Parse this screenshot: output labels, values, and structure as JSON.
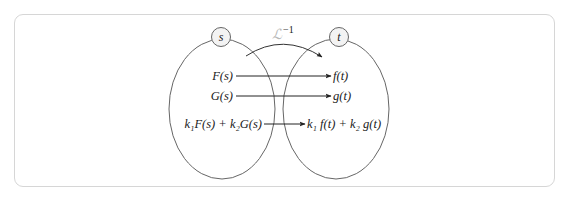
{
  "diagram": {
    "title_operator": {
      "symbol": "ℒ",
      "superscript": "−1"
    },
    "domains": {
      "left": {
        "label": "s"
      },
      "right": {
        "label": "t"
      }
    },
    "mappings": [
      {
        "from": "F(s)",
        "to": "f(t)"
      },
      {
        "from": "G(s)",
        "to": "g(t)"
      },
      {
        "from": "k₁F(s) + k₂G(s)",
        "to": "k₁ f(t) + k₂ g(t)"
      }
    ],
    "colors": {
      "stroke": "#555555",
      "text": "#1a1a1a",
      "operator": "#b8b8b8",
      "frame": "#d6d6d6"
    }
  }
}
